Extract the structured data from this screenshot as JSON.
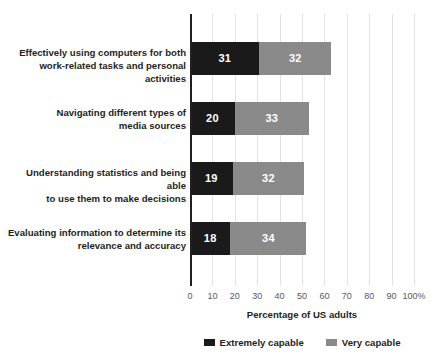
{
  "chart_data": {
    "type": "bar",
    "orientation": "horizontal",
    "stacked": true,
    "title": "",
    "xlabel": "Percentage of US adults",
    "ylabel": "",
    "xlim": [
      0,
      100
    ],
    "grid": true,
    "legend_position": "bottom-center",
    "categories": [
      "Effectively using computers for both work-related tasks and personal activities",
      "Navigating different types of media sources",
      "Understanding statistics and being able to use them to make decisions",
      "Evaluating information to determine its relevance and accuracy"
    ],
    "category_lines": [
      [
        "Effectively using computers for both",
        "work-related tasks and personal activities"
      ],
      [
        "Navigating different types of",
        "media sources"
      ],
      [
        "Understanding statistics and being able",
        "to use them to make decisions"
      ],
      [
        "Evaluating information to determine its",
        "relevance and accuracy"
      ]
    ],
    "series": [
      {
        "name": "Extremely capable",
        "color": "#1a1a1a",
        "values": [
          31,
          20,
          19,
          18
        ]
      },
      {
        "name": "Very capable",
        "color": "#8a8a8a",
        "values": [
          32,
          33,
          32,
          34
        ]
      }
    ],
    "totals": [
      63,
      53,
      51,
      52
    ],
    "xticks": [
      0,
      10,
      20,
      30,
      40,
      50,
      60,
      70,
      80,
      90,
      100
    ],
    "xtick_labels": [
      "0",
      "10",
      "20",
      "30",
      "40",
      "50",
      "60",
      "70",
      "80",
      "90",
      "100%"
    ]
  },
  "legend": {
    "items": [
      {
        "label": "Extremely capable",
        "color": "#1a1a1a"
      },
      {
        "label": "Very capable",
        "color": "#8a8a8a"
      }
    ]
  },
  "colors": {
    "extremely_capable": "#1a1a1a",
    "very_capable": "#8a8a8a",
    "gridline": "#e3e3e3",
    "axis": "#231f20",
    "tick_text": "#58595b",
    "background": "#ffffff"
  }
}
